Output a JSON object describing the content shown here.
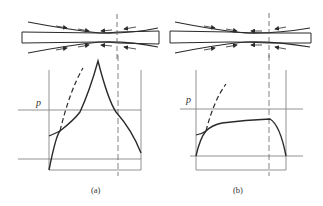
{
  "figure": {
    "panels": [
      {
        "id": "a",
        "caption": "(a)",
        "axis_label": "p",
        "curve_shape": "friction hill with sharp peak at neutral point",
        "dashed_curve": "rising dashed curve near entry"
      },
      {
        "id": "b",
        "caption": "(b)",
        "axis_label": "p",
        "curve_shape": "flat plateau pressure distribution dropping at exit",
        "dashed_curve": "rising dashed curve near entry"
      }
    ]
  },
  "colors": {
    "line": "#2a2a2a",
    "thin_line": "#666666",
    "background": "#ffffff"
  }
}
